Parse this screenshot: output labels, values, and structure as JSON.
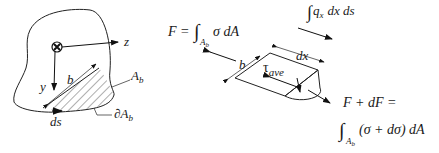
{
  "figure": {
    "left_panel": {
      "axis_z": "z",
      "axis_y": "y",
      "width_label": "b",
      "area_label": "A",
      "area_sub": "b",
      "boundary_label": "∂A",
      "boundary_sub": "b",
      "arc_label": "ds"
    },
    "top_equation": {
      "lhs": "F =",
      "integral": "∫",
      "sub": "A",
      "subsub": "b",
      "integrand": "σ dA"
    },
    "flow_equation": {
      "integral": "∫",
      "text": "q",
      "sub": "x",
      "rest": "dx ds"
    },
    "element": {
      "width_label": "b",
      "length_label": "dx",
      "shear": "τ",
      "shear_sub": "ave"
    },
    "right_equation": {
      "line1": "F + dF  =",
      "integral": "∫",
      "sub": "A",
      "subsub": "b",
      "integrand": "(σ + dσ) dA"
    }
  }
}
